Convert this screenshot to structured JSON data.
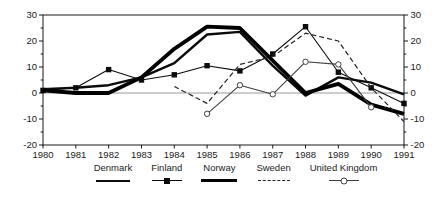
{
  "chart_data": {
    "type": "line",
    "title": "",
    "xlabel": "",
    "ylabel": "",
    "x": [
      1980,
      1981,
      1982,
      1983,
      1984,
      1985,
      1986,
      1987,
      1988,
      1989,
      1990,
      1991
    ],
    "ylim": [
      -20,
      30
    ],
    "yticks_major": [
      30,
      20,
      10,
      0,
      -10,
      -20
    ],
    "ytick_minor_step": 5,
    "dual_y_axis": true,
    "grid": "zero-line-only",
    "zero_line_color": "#9a9a9a",
    "axis_color": "#000000",
    "legend_position": "bottom",
    "series": [
      {
        "name": "Denmark",
        "line": "solid-medium",
        "marker": "none",
        "color": "#0b0b0b",
        "values": [
          1.5,
          2,
          3,
          6,
          11.5,
          22.5,
          23.5,
          10.5,
          -1,
          6,
          4,
          -0.5
        ]
      },
      {
        "name": "Finland",
        "line": "solid-thin",
        "marker": "filled-square",
        "color": "#0b0b0b",
        "values": [
          1,
          2,
          9,
          5,
          7,
          10.5,
          8.5,
          15,
          25.5,
          8,
          2,
          -4
        ]
      },
      {
        "name": "Norway",
        "line": "solid-thick",
        "marker": "none",
        "color": "#000000",
        "values": [
          1,
          0,
          0,
          6,
          17,
          25.5,
          25,
          12.5,
          0,
          3.5,
          -4.5,
          -8
        ]
      },
      {
        "name": "Sweden",
        "line": "dashed",
        "marker": "none",
        "color": "#222222",
        "values": [
          null,
          null,
          null,
          null,
          2.5,
          -4,
          11,
          14,
          23,
          20,
          2,
          -11
        ]
      },
      {
        "name": "United Kingdom",
        "line": "solid-thin",
        "marker": "open-circle",
        "color": "#3f3f3f",
        "values": [
          null,
          null,
          null,
          null,
          null,
          -8,
          3,
          -0.5,
          12,
          11,
          -5.5,
          null
        ]
      }
    ]
  }
}
